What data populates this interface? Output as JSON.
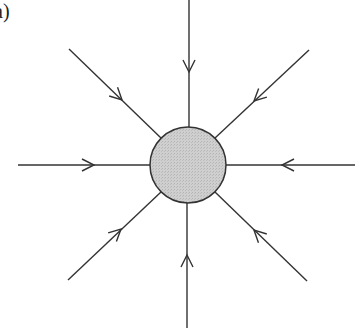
{
  "panel_label": "a)",
  "colors": {
    "line": "#333333",
    "circle_fill": "#c8c8c8",
    "circle_stroke": "#333333",
    "background": "#ffffff"
  },
  "center": {
    "x": 188,
    "y": 165,
    "r": 38
  },
  "arrows": [
    {
      "name": "arrow-top",
      "x1": 189,
      "y1": 0,
      "x2": 189,
      "y2": 127,
      "tip": [
        189,
        72
      ]
    },
    {
      "name": "arrow-top-right",
      "x1": 309,
      "y1": 50,
      "x2": 215,
      "y2": 138,
      "tip": [
        254,
        101
      ]
    },
    {
      "name": "arrow-right",
      "x1": 355,
      "y1": 165,
      "x2": 226,
      "y2": 165,
      "tip": [
        282,
        165
      ]
    },
    {
      "name": "arrow-bottom-right",
      "x1": 307,
      "y1": 281,
      "x2": 215,
      "y2": 192,
      "tip": [
        254,
        230
      ]
    },
    {
      "name": "arrow-bottom",
      "x1": 187,
      "y1": 328,
      "x2": 187,
      "y2": 203,
      "tip": [
        187,
        255
      ]
    },
    {
      "name": "arrow-bottom-left",
      "x1": 68,
      "y1": 280,
      "x2": 161,
      "y2": 192,
      "tip": [
        121,
        229
      ]
    },
    {
      "name": "arrow-left",
      "x1": 18,
      "y1": 165,
      "x2": 150,
      "y2": 165,
      "tip": [
        94,
        165
      ]
    },
    {
      "name": "arrow-top-left",
      "x1": 69,
      "y1": 49,
      "x2": 161,
      "y2": 138,
      "tip": [
        122,
        100
      ]
    }
  ]
}
